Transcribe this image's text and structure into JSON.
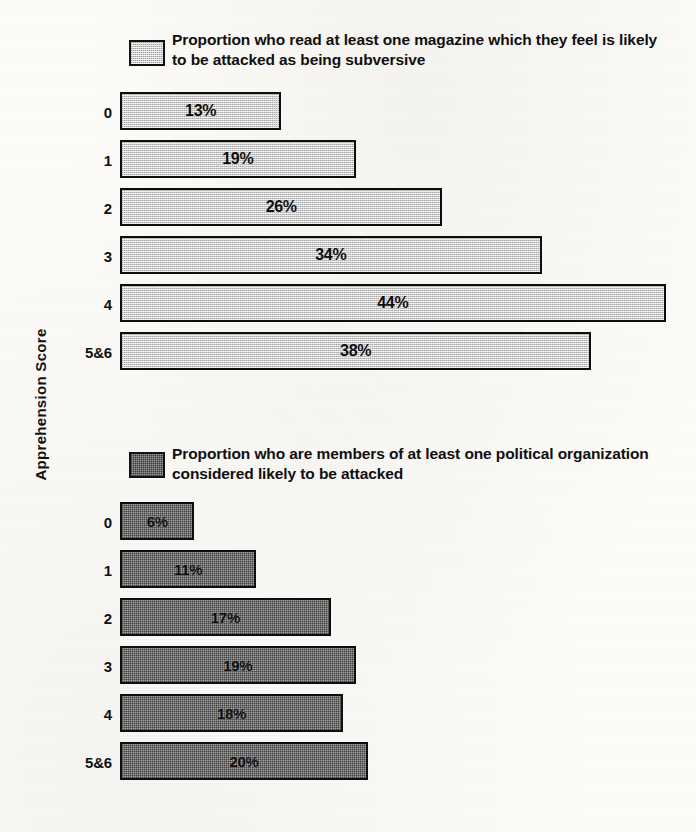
{
  "axis": {
    "y_title": "Apprehension Score"
  },
  "charts": [
    {
      "id": "chart-top",
      "legend_label": "Proportion who read at least one magazine which they feel is likely to be attacked as being subversive",
      "swatch_name": "legend-swatch-light",
      "rows": [
        {
          "category": "0",
          "value": 13,
          "value_label": "13%"
        },
        {
          "category": "1",
          "value": 19,
          "value_label": "19%"
        },
        {
          "category": "2",
          "value": 26,
          "value_label": "26%"
        },
        {
          "category": "3",
          "value": 34,
          "value_label": "34%"
        },
        {
          "category": "4",
          "value": 44,
          "value_label": "44%"
        },
        {
          "category": "5&6",
          "value": 38,
          "value_label": "38%"
        }
      ]
    },
    {
      "id": "chart-bottom",
      "legend_label": "Proportion who are members of at least one political organization considered likely to be attacked",
      "swatch_name": "legend-swatch-dark",
      "rows": [
        {
          "category": "0",
          "value": 6,
          "value_label": "6%"
        },
        {
          "category": "1",
          "value": 11,
          "value_label": "11%"
        },
        {
          "category": "2",
          "value": 17,
          "value_label": "17%"
        },
        {
          "category": "3",
          "value": 19,
          "value_label": "19%"
        },
        {
          "category": "4",
          "value": 18,
          "value_label": "18%"
        },
        {
          "category": "5&6",
          "value": 20,
          "value_label": "20%"
        }
      ]
    }
  ],
  "colors": {
    "ink": "#0e0e0e",
    "bar_light": "#cecece",
    "bar_dark": "#a3a3a3",
    "paper": "#fdfcf9"
  },
  "chart_data": [
    {
      "type": "bar",
      "orientation": "horizontal",
      "title": "Proportion who read at least one magazine which they feel is likely to be attacked as being subversive",
      "xlabel": "",
      "ylabel": "Apprehension Score",
      "categories": [
        "0",
        "1",
        "2",
        "3",
        "4",
        "5&6"
      ],
      "values": [
        13,
        19,
        26,
        34,
        44,
        38
      ],
      "value_labels": [
        "13%",
        "19%",
        "26%",
        "34%",
        "44%",
        "38%"
      ],
      "units": "percent",
      "xlim": [
        0,
        46
      ],
      "grid": false,
      "legend_position": "top-left",
      "legend": [
        "Proportion who read at least one magazine which they feel is likely to be attacked as being subversive"
      ]
    },
    {
      "type": "bar",
      "orientation": "horizontal",
      "title": "Proportion who are members of at least one political organization considered likely to be attacked",
      "xlabel": "",
      "ylabel": "Apprehension Score",
      "categories": [
        "0",
        "1",
        "2",
        "3",
        "4",
        "5&6"
      ],
      "values": [
        6,
        11,
        17,
        19,
        18,
        20
      ],
      "value_labels": [
        "6%",
        "11%",
        "17%",
        "19%",
        "18%",
        "20%"
      ],
      "units": "percent",
      "xlim": [
        0,
        46
      ],
      "grid": false,
      "legend_position": "top-left",
      "legend": [
        "Proportion who are members of at least one political organization considered likely to be attacked"
      ]
    }
  ],
  "scale": {
    "px_per_percent": 12.4,
    "bar_origin_x": 120
  }
}
